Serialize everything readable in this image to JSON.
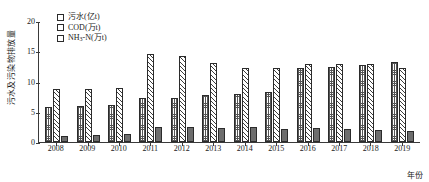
{
  "chart_data": {
    "type": "bar",
    "title": "",
    "xlabel": "年份",
    "ylabel": "污水及污染物排放量",
    "ylim": [
      0,
      20
    ],
    "yticks": [
      0,
      5,
      10,
      15,
      20
    ],
    "grid": false,
    "legend_position": "top-left",
    "categories": [
      "2008",
      "2009",
      "2010",
      "2011",
      "2012",
      "2013",
      "2014",
      "2015",
      "2016",
      "2017",
      "2018",
      "2019"
    ],
    "series": [
      {
        "name": "COD(万t)",
        "pattern": "dotted",
        "values": [
          5.8,
          6.0,
          6.2,
          7.2,
          7.3,
          7.8,
          8.0,
          8.3,
          12.2,
          12.4,
          12.7,
          13.3
        ]
      },
      {
        "name": "污水(亿t)",
        "pattern": "diagonal-hatch",
        "values": [
          8.7,
          8.8,
          9.0,
          14.6,
          14.3,
          13.1,
          12.2,
          12.2,
          12.9,
          12.9,
          12.9,
          12.3
        ]
      },
      {
        "name": "NH3-N(万t)",
        "pattern": "solid",
        "values": [
          1.0,
          1.2,
          1.3,
          2.5,
          2.4,
          2.3,
          2.4,
          2.2,
          2.3,
          2.2,
          2.0,
          1.9
        ]
      }
    ]
  },
  "legend": {
    "items": [
      {
        "label_main": "污水(亿t)",
        "label_sub": "",
        "label_tail": ""
      },
      {
        "label_main": "COD(万t)",
        "label_sub": "",
        "label_tail": ""
      },
      {
        "label_main": "NH",
        "label_sub": "3",
        "label_tail": "-N(万t)"
      }
    ]
  }
}
